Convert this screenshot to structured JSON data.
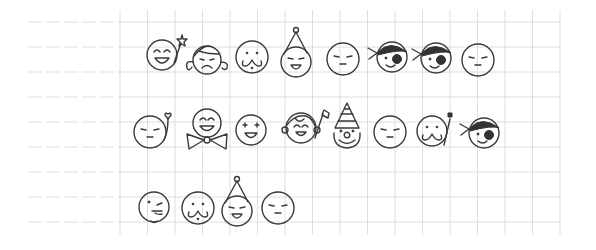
{
  "scene": {
    "description": "Hand-drawn pencil doodle faces on grid notebook paper",
    "paper": {
      "background": "#ffffff",
      "grid_color": "#d6d6d6",
      "ink_color": "#3a3a3a"
    },
    "rows": [
      {
        "faces": [
          {
            "type": "grin-star-wand",
            "x": 162,
            "y": 55
          },
          {
            "type": "curly-hair-sad",
            "x": 207,
            "y": 58
          },
          {
            "type": "mustache",
            "x": 252,
            "y": 57
          },
          {
            "type": "party-hat-grin",
            "x": 296,
            "y": 60
          },
          {
            "type": "meh",
            "x": 343,
            "y": 59
          },
          {
            "type": "pirate-bandana",
            "x": 390,
            "y": 57
          },
          {
            "type": "pirate-bandana",
            "x": 434,
            "y": 58
          },
          {
            "type": "meh",
            "x": 478,
            "y": 60
          }
        ]
      },
      {
        "faces": [
          {
            "type": "meh-heart-wand",
            "x": 150,
            "y": 132
          },
          {
            "type": "bowtie-grin",
            "x": 207,
            "y": 123
          },
          {
            "type": "sparkle-eyes",
            "x": 251,
            "y": 130
          },
          {
            "type": "boy-flag",
            "x": 301,
            "y": 128
          },
          {
            "type": "clown-hat",
            "x": 347,
            "y": 131
          },
          {
            "type": "meh",
            "x": 390,
            "y": 132
          },
          {
            "type": "mustache-wand",
            "x": 432,
            "y": 131
          },
          {
            "type": "pirate-bandana",
            "x": 482,
            "y": 133
          }
        ]
      },
      {
        "faces": [
          {
            "type": "wink-goatee",
            "x": 154,
            "y": 207
          },
          {
            "type": "mustache",
            "x": 198,
            "y": 208
          },
          {
            "type": "party-hat-grin",
            "x": 237,
            "y": 209
          },
          {
            "type": "meh",
            "x": 278,
            "y": 208
          }
        ]
      }
    ]
  }
}
